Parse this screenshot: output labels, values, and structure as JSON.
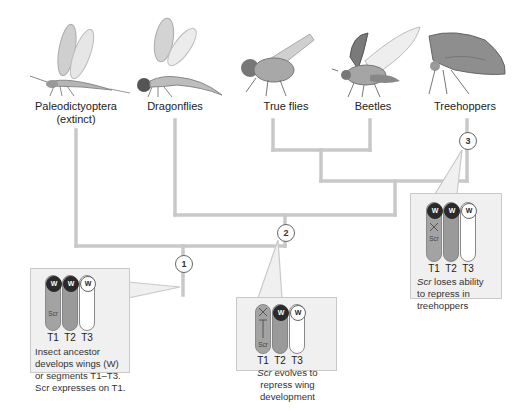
{
  "taxa": [
    {
      "id": "paleodictyoptera",
      "label": "Paleodictyoptera",
      "sublabel": "(extinct)"
    },
    {
      "id": "dragonflies",
      "label": "Dragonflies"
    },
    {
      "id": "true-flies",
      "label": "True flies"
    },
    {
      "id": "beetles",
      "label": "Beetles"
    },
    {
      "id": "treehoppers",
      "label": "Treehoppers"
    }
  ],
  "nodes": [
    {
      "id": 1,
      "label": "1"
    },
    {
      "id": 2,
      "label": "2"
    },
    {
      "id": 3,
      "label": "3"
    }
  ],
  "callouts": [
    {
      "node": "1",
      "segments": [
        "T1",
        "T2",
        "T3"
      ],
      "wings": [
        "W",
        "W",
        "W"
      ],
      "scr_label": "Scr",
      "caption_lines": [
        "Insect ancestor",
        "develops wings (W)",
        "or segments T1–T3.",
        "Scr expresses on T1."
      ]
    },
    {
      "node": "2",
      "segments": [
        "T1",
        "T2",
        "T3"
      ],
      "wings": [
        "W",
        "W"
      ],
      "scr_label": "Scr",
      "caption_italic": "Scr",
      "caption_lines": [
        " evolves to",
        "repress wing",
        "development"
      ]
    },
    {
      "node": "3",
      "segments": [
        "T1",
        "T2",
        "T3"
      ],
      "wings": [
        "W",
        "W",
        "W"
      ],
      "scr_label": "Scr",
      "caption_italic": "Scr",
      "caption_lines": [
        " loses ability",
        "to repress in",
        "treehoppers"
      ]
    }
  ],
  "colors": {
    "tree_line": "#c8c8c8",
    "box_bg": "#f0f0f0",
    "box_border": "#c9c9c9",
    "segment_fill": "#a0a0a0",
    "wing_dark": "#2a2a2a"
  }
}
